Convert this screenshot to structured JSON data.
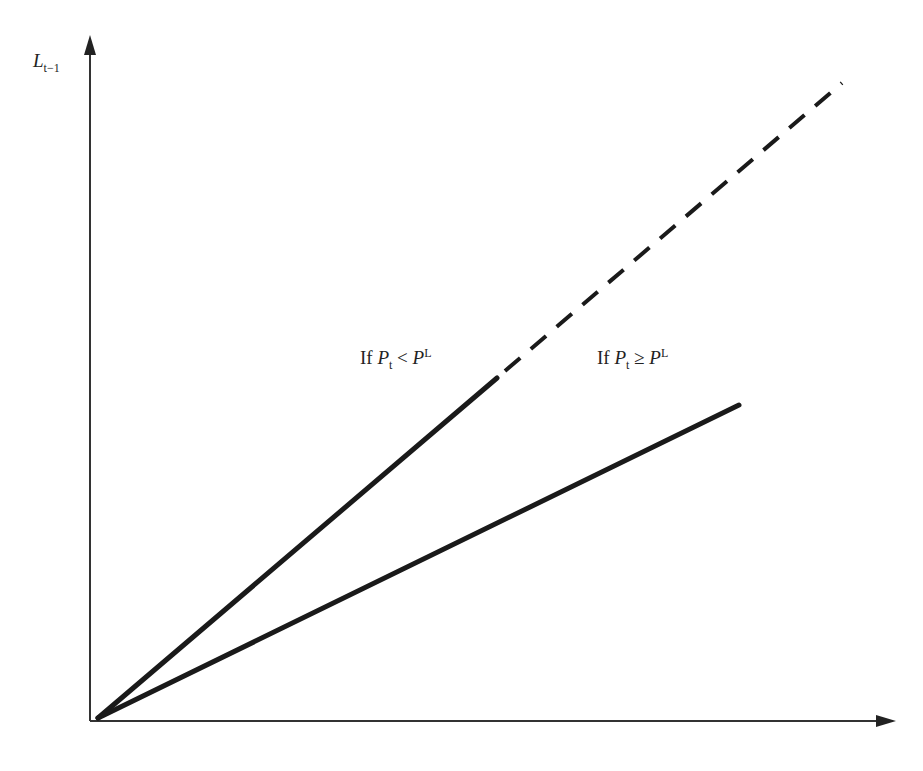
{
  "diagram": {
    "y_axis_label": {
      "main": "L",
      "subscript": "t−1"
    },
    "x_axis_label": "",
    "lines": [
      {
        "name": "steep-line",
        "style": "solid",
        "label": {
          "prefix": "If ",
          "var": "P",
          "sub": "t",
          "op": " < ",
          "var2": "P",
          "sup": "L"
        }
      },
      {
        "name": "steep-line-extension",
        "style": "dashed"
      },
      {
        "name": "shallow-line",
        "style": "solid",
        "label": {
          "prefix": "If ",
          "var": "P",
          "sub": "t",
          "op": " ≥ ",
          "var2": "P",
          "sup": "L"
        }
      }
    ],
    "colors": {
      "line": "#1a1a1a",
      "axis": "#333333",
      "background": "#ffffff"
    }
  }
}
